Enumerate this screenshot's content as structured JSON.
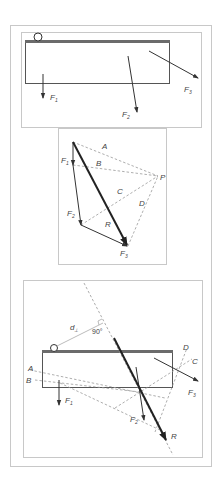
{
  "figure": {
    "panels": [
      {
        "id": "top",
        "description": "Rigid body with pivot and three applied forces",
        "labels": {
          "f1": "F",
          "f1_sub": "1",
          "f2": "F",
          "f2_sub": "2",
          "f3": "F",
          "f3_sub": "3"
        }
      },
      {
        "id": "middle",
        "description": "Force polygon with pole P and rays A, B, C, D",
        "labels": {
          "a": "A",
          "b": "B",
          "c": "C",
          "d": "D",
          "p": "P",
          "r": "R",
          "f1": "F",
          "f1_sub": "1",
          "f2": "F",
          "f2_sub": "2",
          "f3": "F",
          "f3_sub": "3"
        }
      },
      {
        "id": "bottom",
        "description": "Funicular (string) polygon locating the resultant line of action",
        "labels": {
          "d_perp": "d",
          "d_perp_sub": "⊥",
          "angle": "90°",
          "a": "A",
          "b": "B",
          "c": "C",
          "d": "D",
          "r": "R",
          "f1": "F",
          "f1_sub": "1",
          "f2": "F",
          "f2_sub": "2",
          "f3": "F",
          "f3_sub": "3"
        }
      }
    ],
    "colors": {
      "frame": "#c8c8c8",
      "ink": "#333333",
      "dashed": "#999999",
      "bar": "#6b6b6b"
    }
  }
}
